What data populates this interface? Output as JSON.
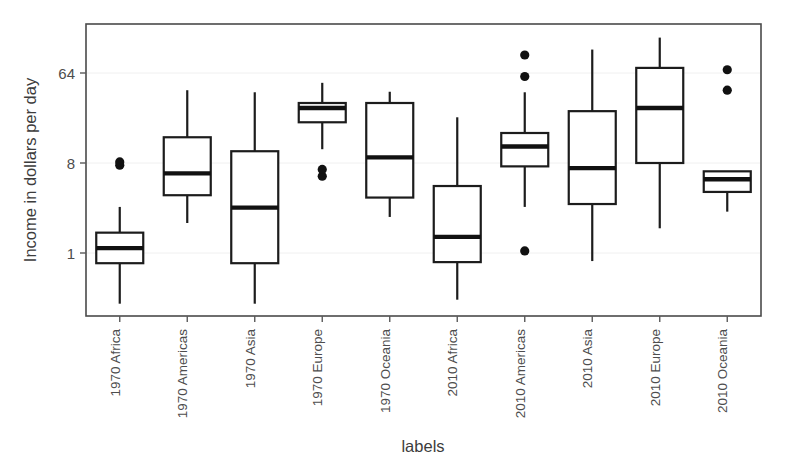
{
  "chart_data": {
    "type": "box",
    "title": "",
    "xlabel": "labels",
    "ylabel": "Income in dollars per day",
    "y_scale": "log2",
    "grid": true,
    "legend": "none",
    "y_ticks": [
      {
        "label": "1",
        "value": 1
      },
      {
        "label": "8",
        "value": 8
      },
      {
        "label": "64",
        "value": 64
      }
    ],
    "ylim": [
      0.23,
      180
    ],
    "categories": [
      "1970 Africa",
      "1970 Americas",
      "1970 Asia",
      "1970 Europe",
      "1970 Oceania",
      "2010 Africa",
      "2010 Americas",
      "2010 Asia",
      "2010 Europe",
      "2010 Oceania"
    ],
    "boxes": [
      {
        "label": "1970 Africa",
        "whisker_low": 0.31,
        "q1": 0.79,
        "median": 1.12,
        "q3": 1.6,
        "whisker_high": 2.9,
        "outliers": [
          7.6,
          8.2
        ]
      },
      {
        "label": "1970 Americas",
        "whisker_low": 2.0,
        "q1": 3.8,
        "median": 6.3,
        "q3": 14.5,
        "whisker_high": 43.0,
        "outliers": []
      },
      {
        "label": "1970 Asia",
        "whisker_low": 0.31,
        "q1": 0.79,
        "median": 2.85,
        "q3": 10.5,
        "whisker_high": 41.0,
        "outliers": []
      },
      {
        "label": "1970 Europe",
        "whisker_low": 11.0,
        "q1": 20.5,
        "median": 28.5,
        "q3": 32.0,
        "whisker_high": 51.0,
        "outliers": [
          5.9,
          6.9
        ]
      },
      {
        "label": "1970 Oceania",
        "whisker_low": 2.3,
        "q1": 3.6,
        "median": 9.1,
        "q3": 32.0,
        "whisker_high": 41.5,
        "outliers": []
      },
      {
        "label": "2010 Africa",
        "whisker_low": 0.34,
        "q1": 0.81,
        "median": 1.45,
        "q3": 4.7,
        "whisker_high": 23.0,
        "outliers": []
      },
      {
        "label": "2010 Americas",
        "whisker_low": 2.9,
        "q1": 7.4,
        "median": 11.7,
        "q3": 16.0,
        "whisker_high": 41.0,
        "outliers": [
          97.0,
          59.0,
          1.05
        ]
      },
      {
        "label": "2010 Asia",
        "whisker_low": 0.83,
        "q1": 3.1,
        "median": 7.1,
        "q3": 26.5,
        "whisker_high": 110.0,
        "outliers": []
      },
      {
        "label": "2010 Europe",
        "whisker_low": 1.77,
        "q1": 8.0,
        "median": 28.5,
        "q3": 72.0,
        "whisker_high": 145.0,
        "outliers": []
      },
      {
        "label": "2010 Oceania",
        "whisker_low": 2.6,
        "q1": 4.1,
        "median": 5.5,
        "q3": 6.6,
        "whisker_high": 6.6,
        "outliers": [
          69.0,
          43.0
        ]
      }
    ]
  }
}
